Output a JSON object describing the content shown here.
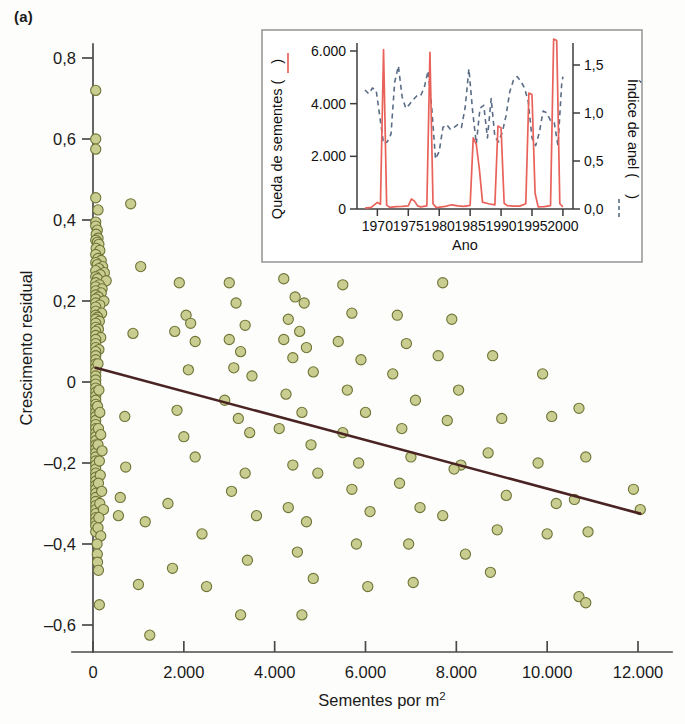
{
  "figure": {
    "panel_label": "(a)"
  },
  "main_axis": {
    "ylabel": "Crescimento residual",
    "xlabel_text": "Sementes por m",
    "xlabel_sup": "2",
    "xticklabels": [
      "0",
      "2.000",
      "4.000",
      "6.000",
      "8.000",
      "10.000",
      "12.000"
    ],
    "yticklabels": [
      "0,8",
      "0,6",
      "0,4",
      "0,2",
      "0",
      "–0,2",
      "–0,4",
      "–0,6"
    ]
  },
  "inset_axis": {
    "ylabel_left_text": "Queda de sementes (",
    "ylabel_left_close": ")",
    "ylabel_right_text": "Índice de anel (",
    "ylabel_right_close": ")",
    "xlabel": "Ano",
    "xticklabels": [
      "1970",
      "1975",
      "1980",
      "1985",
      "1990",
      "1995",
      "2000"
    ],
    "yticklabels_left": [
      "0",
      "2.000",
      "4.000",
      "6.000"
    ],
    "yticklabels_right": [
      "0,0",
      "0,5",
      "1,0",
      "1,5"
    ]
  },
  "colors": {
    "marker_fill": "#c9cd90",
    "marker_edge": "#6f7436",
    "trend_line": "#4a2323",
    "seed_line": "#e8625a",
    "ring_line": "#5a6c86",
    "axis": "#4a4a4a",
    "inset_frame": "#9a9a9a"
  },
  "chart_data": {
    "type": "scatter",
    "title": "",
    "xlabel": "Sementes por m2",
    "ylabel": "Crescimento residual",
    "xlim": [
      -400,
      12600
    ],
    "ylim": [
      -0.68,
      0.85
    ],
    "grid": false,
    "legend": "none",
    "trend_line": {
      "type": "line",
      "x": [
        60,
        12050
      ],
      "y": [
        0.035,
        -0.325
      ],
      "color": "#4a2323",
      "note": "fitted regression line, negative slope"
    },
    "points": [
      [
        60,
        0.72
      ],
      [
        60,
        0.6
      ],
      [
        60,
        0.575
      ],
      [
        60,
        0.455
      ],
      [
        110,
        0.425
      ],
      [
        830,
        0.44
      ],
      [
        60,
        0.395
      ],
      [
        60,
        0.385
      ],
      [
        95,
        0.375
      ],
      [
        70,
        0.365
      ],
      [
        110,
        0.355
      ],
      [
        60,
        0.35
      ],
      [
        95,
        0.345
      ],
      [
        130,
        0.34
      ],
      [
        70,
        0.33
      ],
      [
        150,
        0.325
      ],
      [
        60,
        0.315
      ],
      [
        110,
        0.305
      ],
      [
        180,
        0.3
      ],
      [
        60,
        0.295
      ],
      [
        95,
        0.29
      ],
      [
        210,
        0.285
      ],
      [
        130,
        0.28
      ],
      [
        60,
        0.275
      ],
      [
        250,
        0.27
      ],
      [
        160,
        0.265
      ],
      [
        60,
        0.26
      ],
      [
        100,
        0.255
      ],
      [
        290,
        0.25
      ],
      [
        60,
        0.245
      ],
      [
        140,
        0.24
      ],
      [
        60,
        0.235
      ],
      [
        200,
        0.23
      ],
      [
        60,
        0.225
      ],
      [
        180,
        0.22
      ],
      [
        60,
        0.215
      ],
      [
        120,
        0.21
      ],
      [
        60,
        0.205
      ],
      [
        240,
        0.2
      ],
      [
        60,
        0.195
      ],
      [
        150,
        0.19
      ],
      [
        60,
        0.185
      ],
      [
        60,
        0.175
      ],
      [
        190,
        0.17
      ],
      [
        60,
        0.165
      ],
      [
        100,
        0.16
      ],
      [
        60,
        0.155
      ],
      [
        140,
        0.15
      ],
      [
        60,
        0.145
      ],
      [
        60,
        0.135
      ],
      [
        120,
        0.13
      ],
      [
        60,
        0.125
      ],
      [
        60,
        0.115
      ],
      [
        170,
        0.11
      ],
      [
        60,
        0.105
      ],
      [
        60,
        0.095
      ],
      [
        60,
        0.085
      ],
      [
        130,
        0.08
      ],
      [
        60,
        0.075
      ],
      [
        60,
        0.065
      ],
      [
        60,
        0.055
      ],
      [
        60,
        0.045
      ],
      [
        60,
        0.035
      ],
      [
        60,
        0.025
      ],
      [
        60,
        0.015
      ],
      [
        60,
        0.005
      ],
      [
        60,
        -0.005
      ],
      [
        60,
        -0.015
      ],
      [
        60,
        -0.025
      ],
      [
        60,
        -0.035
      ],
      [
        60,
        -0.045
      ],
      [
        60,
        -0.055
      ],
      [
        60,
        -0.065
      ],
      [
        60,
        -0.075
      ],
      [
        60,
        -0.085
      ],
      [
        60,
        -0.095
      ],
      [
        60,
        -0.105
      ],
      [
        60,
        -0.115
      ],
      [
        60,
        -0.125
      ],
      [
        60,
        -0.135
      ],
      [
        60,
        -0.145
      ],
      [
        60,
        -0.155
      ],
      [
        60,
        -0.165
      ],
      [
        60,
        -0.175
      ],
      [
        60,
        -0.185
      ],
      [
        60,
        -0.195
      ],
      [
        60,
        -0.205
      ],
      [
        60,
        -0.215
      ],
      [
        60,
        -0.225
      ],
      [
        60,
        -0.235
      ],
      [
        60,
        -0.245
      ],
      [
        60,
        -0.255
      ],
      [
        60,
        -0.265
      ],
      [
        60,
        -0.275
      ],
      [
        60,
        -0.285
      ],
      [
        60,
        -0.295
      ],
      [
        60,
        -0.305
      ],
      [
        60,
        -0.315
      ],
      [
        60,
        -0.325
      ],
      [
        60,
        -0.335
      ],
      [
        60,
        -0.345
      ],
      [
        60,
        -0.355
      ],
      [
        60,
        -0.37
      ],
      [
        110,
        0.045
      ],
      [
        130,
        -0.02
      ],
      [
        100,
        -0.06
      ],
      [
        150,
        -0.075
      ],
      [
        120,
        -0.115
      ],
      [
        170,
        -0.13
      ],
      [
        110,
        -0.155
      ],
      [
        200,
        -0.17
      ],
      [
        140,
        -0.195
      ],
      [
        160,
        -0.23
      ],
      [
        120,
        -0.25
      ],
      [
        190,
        -0.27
      ],
      [
        150,
        -0.3
      ],
      [
        230,
        -0.315
      ],
      [
        130,
        -0.335
      ],
      [
        110,
        -0.36
      ],
      [
        170,
        -0.38
      ],
      [
        90,
        -0.4
      ],
      [
        95,
        -0.425
      ],
      [
        100,
        -0.445
      ],
      [
        120,
        -0.465
      ],
      [
        140,
        -0.55
      ],
      [
        1050,
        0.285
      ],
      [
        880,
        0.12
      ],
      [
        700,
        -0.085
      ],
      [
        720,
        -0.21
      ],
      [
        600,
        -0.285
      ],
      [
        560,
        -0.33
      ],
      [
        1150,
        -0.345
      ],
      [
        1000,
        -0.5
      ],
      [
        1250,
        -0.625
      ],
      [
        1900,
        0.245
      ],
      [
        2050,
        0.165
      ],
      [
        2150,
        0.145
      ],
      [
        1800,
        0.125
      ],
      [
        2250,
        0.1
      ],
      [
        2100,
        0.03
      ],
      [
        1850,
        -0.07
      ],
      [
        2000,
        -0.135
      ],
      [
        2250,
        -0.185
      ],
      [
        1650,
        -0.3
      ],
      [
        1750,
        -0.46
      ],
      [
        2400,
        -0.375
      ],
      [
        2500,
        -0.505
      ],
      [
        3000,
        0.245
      ],
      [
        3150,
        0.195
      ],
      [
        3350,
        0.14
      ],
      [
        3000,
        0.105
      ],
      [
        3250,
        0.075
      ],
      [
        3100,
        0.035
      ],
      [
        3500,
        0.015
      ],
      [
        2900,
        -0.045
      ],
      [
        3200,
        -0.09
      ],
      [
        3450,
        -0.125
      ],
      [
        3350,
        -0.225
      ],
      [
        3050,
        -0.27
      ],
      [
        3600,
        -0.33
      ],
      [
        3400,
        -0.44
      ],
      [
        3250,
        -0.575
      ],
      [
        4200,
        0.255
      ],
      [
        4450,
        0.21
      ],
      [
        4650,
        0.195
      ],
      [
        4300,
        0.155
      ],
      [
        4550,
        0.125
      ],
      [
        4200,
        0.105
      ],
      [
        4700,
        0.085
      ],
      [
        4400,
        0.06
      ],
      [
        4850,
        0.025
      ],
      [
        4250,
        -0.03
      ],
      [
        4600,
        -0.075
      ],
      [
        4100,
        -0.115
      ],
      [
        4800,
        -0.155
      ],
      [
        4400,
        -0.205
      ],
      [
        4950,
        -0.225
      ],
      [
        4300,
        -0.31
      ],
      [
        4700,
        -0.345
      ],
      [
        4500,
        -0.42
      ],
      [
        4850,
        -0.485
      ],
      [
        4600,
        -0.575
      ],
      [
        5500,
        0.24
      ],
      [
        5700,
        0.17
      ],
      [
        5400,
        0.1
      ],
      [
        5900,
        0.055
      ],
      [
        5600,
        -0.02
      ],
      [
        6000,
        -0.075
      ],
      [
        5500,
        -0.125
      ],
      [
        5850,
        -0.2
      ],
      [
        5700,
        -0.265
      ],
      [
        6100,
        -0.32
      ],
      [
        5800,
        -0.4
      ],
      [
        6050,
        -0.505
      ],
      [
        6700,
        0.165
      ],
      [
        6900,
        0.095
      ],
      [
        6600,
        0.02
      ],
      [
        7100,
        -0.045
      ],
      [
        6800,
        -0.115
      ],
      [
        7000,
        -0.185
      ],
      [
        6750,
        -0.25
      ],
      [
        7200,
        -0.31
      ],
      [
        6950,
        -0.4
      ],
      [
        7050,
        -0.495
      ],
      [
        7700,
        0.245
      ],
      [
        7900,
        0.155
      ],
      [
        7600,
        0.065
      ],
      [
        8050,
        -0.02
      ],
      [
        7800,
        -0.095
      ],
      [
        8100,
        -0.205
      ],
      [
        7950,
        -0.215
      ],
      [
        7700,
        -0.33
      ],
      [
        8200,
        -0.425
      ],
      [
        8800,
        0.065
      ],
      [
        9000,
        -0.09
      ],
      [
        8700,
        -0.175
      ],
      [
        9100,
        -0.28
      ],
      [
        8900,
        -0.365
      ],
      [
        8750,
        -0.47
      ],
      [
        9900,
        0.02
      ],
      [
        10100,
        -0.085
      ],
      [
        9800,
        -0.2
      ],
      [
        10200,
        -0.3
      ],
      [
        10000,
        -0.375
      ],
      [
        10700,
        -0.065
      ],
      [
        10850,
        -0.185
      ],
      [
        10600,
        -0.29
      ],
      [
        10900,
        -0.37
      ],
      [
        10700,
        -0.53
      ],
      [
        10850,
        -0.545
      ],
      [
        11900,
        -0.265
      ],
      [
        12050,
        -0.315
      ]
    ]
  },
  "inset_chart_data": {
    "type": "line",
    "title": "",
    "xlabel": "Ano",
    "ylabel_left": "Queda de sementes",
    "ylabel_right": "Índice de anel",
    "xlim": [
      1968,
      2000.5
    ],
    "ylim_left": [
      -200,
      6600
    ],
    "ylim_right": [
      -0.05,
      1.65
    ],
    "grid": false,
    "series": [
      {
        "name": "Queda de sementes",
        "axis": "left",
        "style": "solid",
        "color": "#e8625a",
        "x": [
          1968,
          1969,
          1970,
          1970.5,
          1971,
          1971.5,
          1972,
          1973,
          1974,
          1975,
          1975.5,
          1976,
          1976.5,
          1977,
          1978,
          1978.5,
          1979,
          1979.5,
          1980,
          1981,
          1982,
          1983,
          1984,
          1985,
          1985.5,
          1986,
          1986.5,
          1987,
          1988,
          1989,
          1989.5,
          1990,
          1990.5,
          1991,
          1992,
          1993,
          1994,
          1994.5,
          1995,
          1995.5,
          1996,
          1997,
          1998,
          1998.5,
          1999,
          1999.5,
          2000
        ],
        "y": [
          30,
          60,
          250,
          180,
          6050,
          150,
          60,
          90,
          100,
          120,
          380,
          300,
          120,
          80,
          120,
          5950,
          200,
          60,
          70,
          100,
          160,
          120,
          100,
          140,
          2700,
          2450,
          1500,
          260,
          200,
          160,
          3150,
          3080,
          220,
          130,
          110,
          110,
          200,
          4400,
          4350,
          600,
          80,
          90,
          130,
          6450,
          6400,
          200,
          80
        ]
      },
      {
        "name": "Índice de anel",
        "axis": "right",
        "style": "dashed",
        "color": "#5a6c86",
        "x": [
          1968,
          1968.6,
          1969.2,
          1969.8,
          1970.4,
          1971,
          1971.6,
          1972.2,
          1972.8,
          1973.4,
          1974,
          1974.6,
          1975.2,
          1975.8,
          1976.4,
          1977,
          1977.6,
          1978.2,
          1978.8,
          1979.4,
          1980,
          1980.6,
          1981.2,
          1981.8,
          1982.4,
          1983,
          1983.6,
          1984.2,
          1984.8,
          1985.4,
          1986,
          1986.6,
          1987.2,
          1987.8,
          1988.4,
          1989,
          1989.6,
          1990.2,
          1990.8,
          1991.4,
          1992,
          1992.6,
          1993.2,
          1993.8,
          1994.4,
          1995,
          1995.6,
          1996.2,
          1996.8,
          1997.4,
          1998,
          1998.6,
          1999.2,
          1999.8,
          2000
        ],
        "y": [
          1.24,
          1.2,
          1.26,
          1.24,
          0.96,
          0.68,
          0.7,
          0.78,
          1.32,
          1.49,
          1.17,
          1.05,
          1.09,
          1.14,
          1.18,
          1.18,
          1.27,
          1.44,
          1.05,
          0.52,
          0.6,
          0.85,
          0.88,
          0.83,
          0.85,
          0.88,
          0.85,
          1.06,
          1.46,
          1.02,
          0.68,
          1.05,
          1.08,
          0.74,
          1.15,
          0.75,
          0.7,
          0.8,
          0.97,
          1.22,
          1.34,
          1.38,
          1.33,
          1.26,
          1.12,
          0.74,
          0.66,
          0.8,
          1.02,
          1.0,
          0.92,
          0.9,
          0.66,
          1.3,
          1.38
        ]
      }
    ]
  }
}
